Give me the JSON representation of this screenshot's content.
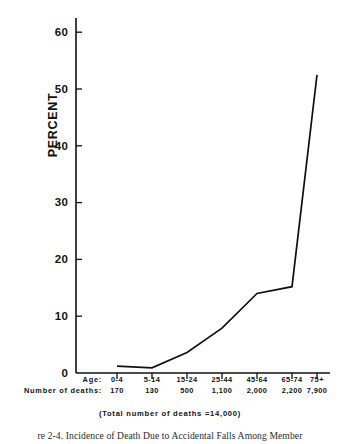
{
  "chart_data": {
    "type": "line",
    "title": "",
    "xlabel": "Age",
    "ylabel": "PERCENT",
    "categories": [
      "0-4",
      "5-14",
      "15-24",
      "25-44",
      "45-64",
      "65-74",
      "75+"
    ],
    "values": [
      1.2,
      0.9,
      3.6,
      7.9,
      14.0,
      15.2,
      52.5
    ],
    "ylim": [
      0,
      60
    ],
    "yticks": [
      0,
      10,
      20,
      30,
      40,
      50,
      60
    ],
    "ytick_labels": [
      "0",
      "10",
      "20",
      "30",
      "40",
      "50",
      "60"
    ],
    "grid": false,
    "legend": false,
    "series": [
      {
        "name": "Percent of deaths due to accidental falls",
        "values": [
          1.2,
          0.9,
          3.6,
          7.9,
          14.0,
          15.2,
          52.5
        ]
      }
    ],
    "annotations": [
      "(Total number of deaths =14,000)"
    ],
    "line_color": "#101010"
  },
  "axis": {
    "y_title": "PERCENT",
    "y_ticks": [
      "60",
      "50",
      "40",
      "30",
      "20",
      "10",
      "0"
    ]
  },
  "table": {
    "rows": [
      {
        "header": "Age:",
        "values": [
          "0-4",
          "5-14",
          "15-24",
          "25-44",
          "45-64",
          "65-74",
          "75+"
        ]
      },
      {
        "header": "Number of deaths:",
        "values": [
          "170",
          "130",
          "500",
          "1,100",
          "2,000",
          "2,200",
          "7,900"
        ]
      }
    ]
  },
  "total_note": "(Total number of deaths =14,000)",
  "figure_caption": "re 2-4.  Incidence of Death Due to  Accidental Falls Among Member"
}
